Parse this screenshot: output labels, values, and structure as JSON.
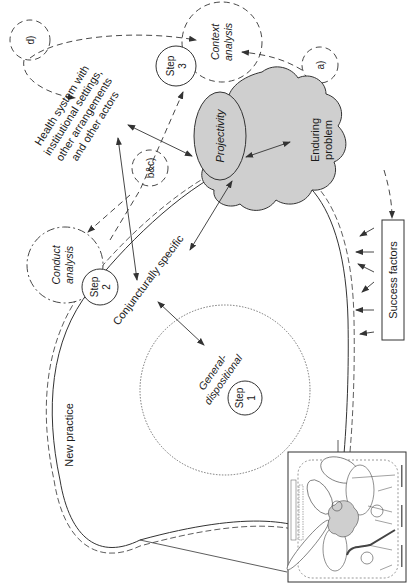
{
  "figure": {
    "orientation": "rotated-90-ccw",
    "colors": {
      "stroke": "#333333",
      "gray_fill": "#cfcfcf",
      "background": "#ffffff"
    },
    "nodes": {
      "health_system": {
        "lines": [
          "Health system with",
          "institutional settings,",
          "other arrangements",
          "and other actors"
        ]
      },
      "projectivity": {
        "label": "Projectivity"
      },
      "enduring_problem": {
        "lines": [
          "Enduring",
          "problem"
        ]
      },
      "context_analysis": {
        "lines": [
          "Context",
          "analysis"
        ]
      },
      "conduct_analysis": {
        "lines": [
          "Conduct",
          "analysis"
        ]
      },
      "step3": {
        "lines": [
          "Step",
          "3"
        ]
      },
      "step2": {
        "lines": [
          "Step",
          "2"
        ]
      },
      "step1": {
        "lines": [
          "Step",
          "1"
        ]
      },
      "conjuncturally_specific": {
        "label": "Conjuncturally specific"
      },
      "general_dispositional": {
        "lines": [
          "General-",
          "dispositional"
        ]
      },
      "new_practice": {
        "label": "New practice"
      },
      "success_factors": {
        "label": "Success factors"
      },
      "marker_a": {
        "label": "a)"
      },
      "marker_bc": {
        "label": "b&c)"
      },
      "marker_d": {
        "label": "d)"
      }
    },
    "inset": {
      "description": "thumbnail of overall framework diagram"
    }
  }
}
